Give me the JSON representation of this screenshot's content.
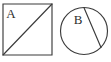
{
  "figure": {
    "background_color": "#ffffff",
    "stroke_color": "#3b3b3b",
    "label_color": "#2e2e2e",
    "shapes": [
      {
        "id": "rectangle-a",
        "kind": "rectangle",
        "label": "A",
        "label_x": 11,
        "label_y": 18,
        "x": 3,
        "y": 4,
        "width": 49,
        "height": 51,
        "internal_line": {
          "kind": "diagonal",
          "x1": 3,
          "y1": 55,
          "x2": 52,
          "y2": 4
        }
      },
      {
        "id": "circle-b",
        "kind": "circle",
        "label": "B",
        "label_x": 78,
        "label_y": 24,
        "cx": 84,
        "cy": 31,
        "r": 24,
        "internal_line": {
          "kind": "chord",
          "x1": 84,
          "y1": 7,
          "x2": 101,
          "y2": 48
        }
      }
    ]
  }
}
